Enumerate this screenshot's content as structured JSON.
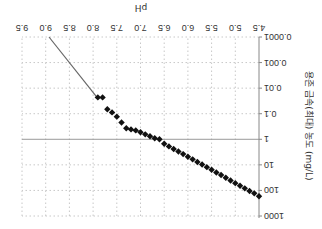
{
  "chart_data": {
    "type": "scatter",
    "title": "",
    "xlabel": "pH",
    "ylabel": "용존 금속(최대) 농도 (mg/L)",
    "xlim": [
      4.5,
      9.5
    ],
    "ylim": [
      0.0001,
      1000
    ],
    "yscale": "log",
    "x_ticks": [
      "4.5",
      "5.0",
      "5.5",
      "6.0",
      "6.5",
      "7.0",
      "7.5",
      "8.0",
      "8.5",
      "9.0",
      "9.5"
    ],
    "y_ticks": [
      "1000",
      "100",
      "10",
      "1",
      "0.1",
      "0.01",
      "0.001",
      "0.0001"
    ],
    "grid": true,
    "legend": null,
    "orientation_note": "image is rendered rotated 180 degrees",
    "series": [
      {
        "name": "measured",
        "marker": "diamond",
        "color": "#111111",
        "x": [
          4.5,
          4.6,
          4.7,
          4.8,
          4.9,
          5.0,
          5.1,
          5.2,
          5.3,
          5.4,
          5.5,
          5.6,
          5.7,
          5.8,
          5.9,
          6.0,
          6.1,
          6.2,
          6.3,
          6.4,
          6.5,
          6.6,
          6.7,
          6.8,
          6.9,
          7.0,
          7.1,
          7.2,
          7.3,
          7.4,
          7.5,
          7.6,
          7.7,
          7.8,
          7.9
        ],
        "y": [
          170,
          130,
          105,
          83,
          66,
          52,
          41,
          32,
          25,
          20,
          15.5,
          12.3,
          9.7,
          7.7,
          6.1,
          4.8,
          3.8,
          3.0,
          2.4,
          1.9,
          1.5,
          1.0,
          0.91,
          0.76,
          0.64,
          0.53,
          0.45,
          0.41,
          0.37,
          0.22,
          0.13,
          0.089,
          0.067,
          0.023,
          0.023
        ]
      },
      {
        "name": "extrapolated",
        "type": "line",
        "color": "#666666",
        "x": [
          7.9,
          8.93
        ],
        "y": [
          0.025,
          0.0001
        ]
      }
    ]
  }
}
